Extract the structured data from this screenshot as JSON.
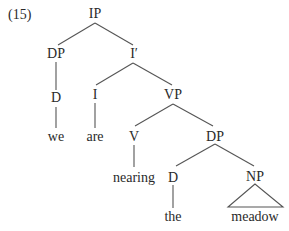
{
  "example_number": "(15)",
  "tree": {
    "nodes": {
      "ip": "IP",
      "dp_subject": "DP",
      "i_bar": "I′",
      "d_subject": "D",
      "i_head": "I",
      "vp": "VP",
      "v_head": "V",
      "dp_object": "DP",
      "d_object": "D",
      "np": "NP"
    },
    "leaves": {
      "we": "we",
      "are": "are",
      "nearing": "nearing",
      "the": "the",
      "meadow": "meadow"
    },
    "edges": [
      [
        "IP",
        "DP"
      ],
      [
        "IP",
        "I′"
      ],
      [
        "DP",
        "D"
      ],
      [
        "D",
        "we"
      ],
      [
        "I′",
        "I"
      ],
      [
        "I′",
        "VP"
      ],
      [
        "I",
        "are"
      ],
      [
        "VP",
        "V"
      ],
      [
        "VP",
        "DP"
      ],
      [
        "V",
        "nearing"
      ],
      [
        "DP",
        "D"
      ],
      [
        "DP",
        "NP"
      ],
      [
        "D",
        "the"
      ],
      [
        "NP",
        "meadow (triangle)"
      ]
    ],
    "colors": {
      "text": "#2a2a2a",
      "lines": "#555555",
      "background": "#ffffff"
    }
  }
}
